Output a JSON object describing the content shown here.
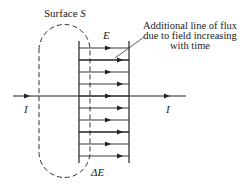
{
  "diagram": {
    "surface_label": "Surface",
    "surface_symbol": "S",
    "field_label": "E",
    "delta_field_label": "ΔE",
    "current_left_label": "I",
    "current_right_label": "I",
    "annotation": {
      "line1": "Additional line of flux",
      "line2": "due to field increasing",
      "line3": "with time"
    },
    "field_lines": [
      {
        "y": 48,
        "thick": false,
        "arrow_x": 111
      },
      {
        "y": 60,
        "thick": true,
        "arrow_x": 123
      },
      {
        "y": 72,
        "thick": false,
        "arrow_x": 111
      },
      {
        "y": 84,
        "thick": false,
        "arrow_x": 123
      },
      {
        "y": 96,
        "thick": true,
        "arrow_x": 111
      },
      {
        "y": 108,
        "thick": false,
        "arrow_x": 123
      },
      {
        "y": 120,
        "thick": false,
        "arrow_x": 111
      },
      {
        "y": 132,
        "thick": true,
        "arrow_x": 123
      },
      {
        "y": 144,
        "thick": false,
        "arrow_x": 111
      },
      {
        "y": 156,
        "thick": false,
        "arrow_x": 123
      }
    ],
    "colors": {
      "ink": "#222222",
      "background": "#ffffff"
    }
  }
}
